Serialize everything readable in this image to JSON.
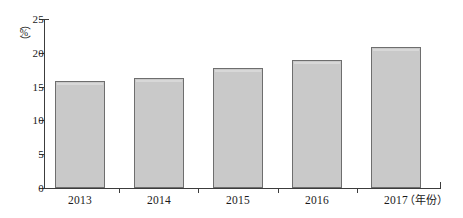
{
  "chart_data": {
    "type": "bar",
    "title": "",
    "subtitle": "",
    "categories": [
      "2013",
      "2014",
      "2015",
      "2016",
      "2017"
    ],
    "values": [
      15.8,
      16.3,
      17.8,
      18.9,
      20.8
    ],
    "series": [
      {
        "name": "",
        "values": [
          15.8,
          16.3,
          17.8,
          18.9,
          20.8
        ]
      }
    ],
    "xlabel": "（年份）",
    "ylabel": "（%）",
    "ylim": [
      0,
      25
    ],
    "y_ticks": [
      "0",
      "5",
      "10",
      "15",
      "20",
      "25"
    ],
    "y_tick_values": [
      0,
      5,
      10,
      15,
      20,
      25
    ],
    "grid": false,
    "legend": false,
    "legend_position": "none",
    "bar_fill_color": "#c9c9c9",
    "bar_border_color": "#6e6e6e",
    "axis_color": "#3c3c3c"
  },
  "axis": {
    "y_unit_open_paren": "（",
    "y_unit_glyph": "%",
    "y_unit_close_paren": "）",
    "x_unit_label": "（年份）"
  }
}
